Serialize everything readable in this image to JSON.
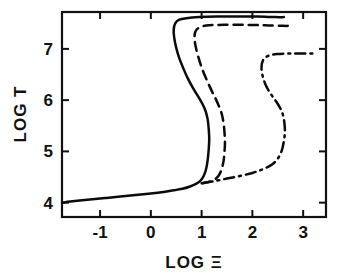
{
  "chart_data": {
    "type": "line",
    "title": "",
    "subtitle": "",
    "xlabel": "LOG Ξ",
    "ylabel": "LOG T",
    "xlim": [
      -1.75,
      3.45
    ],
    "ylim": [
      3.72,
      7.72
    ],
    "xticks": [
      -1,
      0,
      1,
      2,
      3
    ],
    "xticklabels": [
      "-1",
      "0",
      "1",
      "2",
      "3"
    ],
    "yticks": [
      4,
      5,
      6,
      7
    ],
    "yticklabels": [
      "4",
      "5",
      "6",
      "7"
    ],
    "grid": false,
    "legend": null,
    "legend_position": "none",
    "annotations": [],
    "series": [
      {
        "name": "solid-curve",
        "linestyle": "solid",
        "color": "#0b0b0b",
        "points": [
          [
            -1.75,
            4.0
          ],
          [
            -1.5,
            4.03
          ],
          [
            -1.2,
            4.06
          ],
          [
            -0.9,
            4.09
          ],
          [
            -0.6,
            4.12
          ],
          [
            -0.3,
            4.15
          ],
          [
            0.0,
            4.18
          ],
          [
            0.25,
            4.21
          ],
          [
            0.45,
            4.24
          ],
          [
            0.62,
            4.27
          ],
          [
            0.76,
            4.31
          ],
          [
            0.88,
            4.36
          ],
          [
            0.97,
            4.42
          ],
          [
            1.04,
            4.52
          ],
          [
            1.09,
            4.66
          ],
          [
            1.12,
            4.84
          ],
          [
            1.14,
            5.04
          ],
          [
            1.15,
            5.24
          ],
          [
            1.14,
            5.44
          ],
          [
            1.12,
            5.62
          ],
          [
            1.08,
            5.78
          ],
          [
            1.02,
            5.92
          ],
          [
            0.94,
            6.06
          ],
          [
            0.84,
            6.22
          ],
          [
            0.73,
            6.42
          ],
          [
            0.64,
            6.62
          ],
          [
            0.56,
            6.82
          ],
          [
            0.5,
            7.02
          ],
          [
            0.46,
            7.22
          ],
          [
            0.45,
            7.38
          ],
          [
            0.48,
            7.5
          ],
          [
            0.56,
            7.57
          ],
          [
            0.7,
            7.6
          ],
          [
            0.95,
            7.62
          ],
          [
            1.3,
            7.63
          ],
          [
            1.7,
            7.63
          ],
          [
            2.1,
            7.63
          ],
          [
            2.45,
            7.62
          ],
          [
            2.62,
            7.62
          ]
        ]
      },
      {
        "name": "dashed-curve",
        "linestyle": "dashed",
        "color": "#0b0b0b",
        "points": [
          [
            1.0,
            4.38
          ],
          [
            1.12,
            4.4
          ],
          [
            1.24,
            4.44
          ],
          [
            1.33,
            4.52
          ],
          [
            1.39,
            4.64
          ],
          [
            1.43,
            4.8
          ],
          [
            1.45,
            4.98
          ],
          [
            1.46,
            5.18
          ],
          [
            1.45,
            5.38
          ],
          [
            1.43,
            5.56
          ],
          [
            1.4,
            5.72
          ],
          [
            1.35,
            5.86
          ],
          [
            1.28,
            6.02
          ],
          [
            1.19,
            6.2
          ],
          [
            1.09,
            6.42
          ],
          [
            1.0,
            6.64
          ],
          [
            0.93,
            6.86
          ],
          [
            0.88,
            7.06
          ],
          [
            0.86,
            7.24
          ],
          [
            0.89,
            7.36
          ],
          [
            0.98,
            7.43
          ],
          [
            1.15,
            7.46
          ],
          [
            1.45,
            7.47
          ],
          [
            1.85,
            7.47
          ],
          [
            2.25,
            7.46
          ],
          [
            2.6,
            7.45
          ],
          [
            2.8,
            7.45
          ]
        ]
      },
      {
        "name": "dash-dot-curve",
        "linestyle": "dashdot",
        "color": "#0b0b0b",
        "points": [
          [
            1.02,
            4.38
          ],
          [
            1.25,
            4.42
          ],
          [
            1.5,
            4.47
          ],
          [
            1.75,
            4.52
          ],
          [
            2.0,
            4.58
          ],
          [
            2.2,
            4.65
          ],
          [
            2.38,
            4.74
          ],
          [
            2.5,
            4.86
          ],
          [
            2.58,
            5.02
          ],
          [
            2.62,
            5.2
          ],
          [
            2.64,
            5.38
          ],
          [
            2.63,
            5.56
          ],
          [
            2.6,
            5.72
          ],
          [
            2.54,
            5.86
          ],
          [
            2.45,
            6.0
          ],
          [
            2.35,
            6.14
          ],
          [
            2.26,
            6.3
          ],
          [
            2.2,
            6.48
          ],
          [
            2.18,
            6.64
          ],
          [
            2.21,
            6.78
          ],
          [
            2.3,
            6.86
          ],
          [
            2.48,
            6.9
          ],
          [
            2.75,
            6.91
          ],
          [
            3.05,
            6.91
          ],
          [
            3.25,
            6.91
          ]
        ]
      }
    ]
  },
  "axes": {
    "x_label_text": "LOG Ξ",
    "y_label_text": "LOG T"
  }
}
